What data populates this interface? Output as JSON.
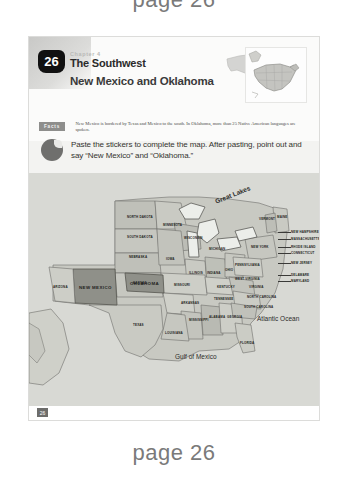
{
  "captions": {
    "top": "page 26",
    "bottom": "page 26"
  },
  "worksheet": {
    "chapter_number": "26",
    "chapter_kicker": "Chapter 4",
    "chapter_title": "The Southwest",
    "subject_title": "New Mexico and Oklahoma",
    "fact_badge": "Facts",
    "fact_text": "New Mexico is bordered by Texas and Mexico to the south. In Oklahoma, more than 25 Native American languages are spoken.",
    "instruction": "Paste the stickers to complete the map. After pasting, point out and say “New Mexico” and “Oklahoma.”",
    "footer_page": "26"
  },
  "map": {
    "water_labels": [
      {
        "name": "Great Lakes",
        "x": 185,
        "y": 18
      },
      {
        "name": "Atlantic Ocean",
        "x": 228,
        "y": 142
      },
      {
        "name": "Gulf of Mexico",
        "x": 146,
        "y": 180
      }
    ],
    "highlighted_states": [
      "NEW MEXICO",
      "OKLAHOMA"
    ],
    "states": [
      {
        "name": "NORTH DAKOTA",
        "x": 98,
        "y": 42
      },
      {
        "name": "SOUTH DAKOTA",
        "x": 98,
        "y": 62
      },
      {
        "name": "NEBRASKA",
        "x": 100,
        "y": 82
      },
      {
        "name": "MINNESOTA",
        "x": 134,
        "y": 50
      },
      {
        "name": "WISCONSIN",
        "x": 155,
        "y": 63
      },
      {
        "name": "IOWA",
        "x": 137,
        "y": 84
      },
      {
        "name": "MICHIGAN",
        "x": 180,
        "y": 74
      },
      {
        "name": "ILLINOIS",
        "x": 160,
        "y": 98
      },
      {
        "name": "INDIANA",
        "x": 178,
        "y": 98
      },
      {
        "name": "OHIO",
        "x": 196,
        "y": 95
      },
      {
        "name": "KANSAS",
        "x": 104,
        "y": 108
      },
      {
        "name": "MISSOURI",
        "x": 145,
        "y": 110
      },
      {
        "name": "KENTUCKY",
        "x": 188,
        "y": 112
      },
      {
        "name": "WEST VIRGINIA",
        "x": 208,
        "y": 105
      },
      {
        "name": "VIRGINIA",
        "x": 220,
        "y": 112
      },
      {
        "name": "TENNESSEE",
        "x": 185,
        "y": 124
      },
      {
        "name": "NORTH CAROLINA",
        "x": 218,
        "y": 122
      },
      {
        "name": "SOUTH CAROLINA",
        "x": 215,
        "y": 132
      },
      {
        "name": "ARKANSAS",
        "x": 152,
        "y": 128
      },
      {
        "name": "MISSISSIPPI",
        "x": 163,
        "y": 145
      },
      {
        "name": "ALABAMA",
        "x": 182,
        "y": 142
      },
      {
        "name": "GEORGIA",
        "x": 200,
        "y": 142
      },
      {
        "name": "LOUISIANA",
        "x": 156,
        "y": 158
      },
      {
        "name": "FLORIDA",
        "x": 213,
        "y": 168
      },
      {
        "name": "TEXAS",
        "x": 106,
        "y": 150
      },
      {
        "name": "ARIZONA",
        "x": 28,
        "y": 113
      },
      {
        "name": "NEW MEXICO",
        "x": 58,
        "y": 114
      },
      {
        "name": "OKLAHOMA",
        "x": 113,
        "y": 114
      },
      {
        "name": "MAINE",
        "x": 253,
        "y": 38
      },
      {
        "name": "VERMONT",
        "x": 233,
        "y": 42
      },
      {
        "name": "NEW YORK",
        "x": 226,
        "y": 68
      },
      {
        "name": "PENNSYLVANIA",
        "x": 215,
        "y": 86
      }
    ],
    "leader_states": [
      {
        "name": "NEW HAMPSHIRE",
        "x": 262,
        "y": 57
      },
      {
        "name": "MASSACHUSETTS",
        "x": 262,
        "y": 64
      },
      {
        "name": "RHODE ISLAND",
        "x": 262,
        "y": 72
      },
      {
        "name": "CONNECTICUT",
        "x": 262,
        "y": 78
      },
      {
        "name": "NEW JERSEY",
        "x": 262,
        "y": 88
      },
      {
        "name": "DELAWARE",
        "x": 262,
        "y": 100
      },
      {
        "name": "MARYLAND",
        "x": 262,
        "y": 106
      }
    ]
  },
  "colors": {
    "page_bg": "#f3f3f1",
    "map_bg": "#d8d9d4",
    "highlight": "#8f9089",
    "land": "#c3c4bd",
    "caption": "#7a7a7a",
    "shield": "#111111"
  }
}
